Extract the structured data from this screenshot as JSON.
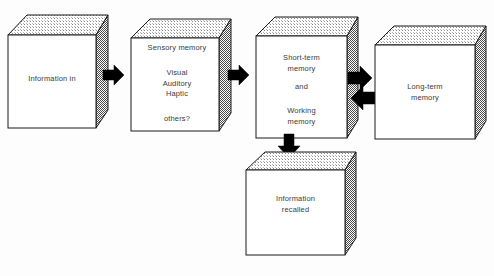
{
  "diagram": {
    "style": {
      "front_face_color": "#ffffff",
      "top_face_color": "#e8e8e8",
      "side_face_color": "#b4b4b4",
      "outline_color": "#1a1a1a",
      "arrow_color": "#000000",
      "text_color": "#3a3a3a",
      "background_color": "#fdfdfd"
    },
    "boxes": [
      {
        "id": "information-in",
        "name": "information-in-box",
        "lines": [
          "Information in"
        ]
      },
      {
        "id": "sensory-memory",
        "name": "sensory-memory-box",
        "heading": "Sensory memory",
        "modalities": "Visual\nAuditory\nHaptic",
        "others": "others?"
      },
      {
        "id": "short-term-memory",
        "name": "short-term-memory-box",
        "heading": "Short-term\nmemory",
        "conjunction": "and",
        "working": "Working\nmemory"
      },
      {
        "id": "long-term-memory",
        "name": "long-term-memory-box",
        "lines": "Long-term\nmemory"
      },
      {
        "id": "information-recalled",
        "name": "information-recalled-box",
        "lines": "Information\nrecalled"
      }
    ],
    "arrows": [
      {
        "id": "arrow-in-to-sensory",
        "direction": "right",
        "from": "information-in",
        "to": "sensory-memory"
      },
      {
        "id": "arrow-sensory-to-stm",
        "direction": "right",
        "from": "sensory-memory",
        "to": "short-term-memory"
      },
      {
        "id": "arrow-stm-to-ltm",
        "direction": "right",
        "from": "short-term-memory",
        "to": "long-term-memory"
      },
      {
        "id": "arrow-ltm-to-stm",
        "direction": "left",
        "from": "long-term-memory",
        "to": "short-term-memory"
      },
      {
        "id": "arrow-stm-to-recalled",
        "direction": "down",
        "from": "short-term-memory",
        "to": "information-recalled"
      }
    ]
  }
}
